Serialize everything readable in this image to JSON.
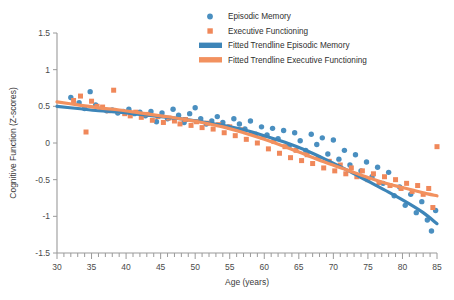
{
  "chart_data": {
    "type": "scatter",
    "title": "",
    "xlabel": "Age (years)",
    "ylabel": "Cognitive Function (Z-scores)",
    "xlim": [
      30,
      85
    ],
    "ylim": [
      -1.5,
      1.5
    ],
    "xticks": [
      30,
      35,
      40,
      45,
      50,
      55,
      60,
      65,
      70,
      75,
      80,
      85
    ],
    "xtick_labels": [
      "30",
      "35",
      "40",
      "45",
      "50",
      "55",
      "60",
      "65",
      "70",
      "75",
      "80",
      "85"
    ],
    "yticks": [
      1.5,
      1,
      0.5,
      0,
      -0.5,
      -1,
      -1.5
    ],
    "ytick_labels": [
      "1.5",
      "1",
      "0.5",
      "0",
      "-0.5",
      "-1",
      "-1.5"
    ],
    "minor_xtick_step": 1,
    "grid": false,
    "legend_position": "top-center",
    "colors": {
      "episodic_memory": "#4a8fc0",
      "executive_functioning": "#f0885a",
      "trendline_episodic_memory": "#3d85b8",
      "trendline_executive_functioning": "#f2915f",
      "axis": "#9a9a9a",
      "text": "#3b3b3b",
      "background": "#ffffff"
    },
    "legend": [
      {
        "label": "Episodic Memory",
        "marker": "circle",
        "color": "#4a8fc0"
      },
      {
        "label": "Executive Functioning",
        "marker": "square",
        "color": "#f0885a"
      },
      {
        "label": "Fitted Trendline Episodic Memory",
        "marker": "line",
        "color": "#3d85b8"
      },
      {
        "label": "Fitted Trendline Executive Functioning",
        "marker": "line",
        "color": "#f2915f"
      }
    ],
    "series": [
      {
        "name": "Episodic Memory",
        "marker": "circle",
        "color": "#4a8fc0",
        "points": [
          [
            32.0,
            0.62
          ],
          [
            33.2,
            0.55
          ],
          [
            34.0,
            0.47
          ],
          [
            34.8,
            0.7
          ],
          [
            35.6,
            0.52
          ],
          [
            36.4,
            0.46
          ],
          [
            37.2,
            0.44
          ],
          [
            38.0,
            0.45
          ],
          [
            38.8,
            0.41
          ],
          [
            39.6,
            0.43
          ],
          [
            40.4,
            0.46
          ],
          [
            41.2,
            0.4
          ],
          [
            42.0,
            0.42
          ],
          [
            42.8,
            0.37
          ],
          [
            43.6,
            0.43
          ],
          [
            44.4,
            0.29
          ],
          [
            45.2,
            0.41
          ],
          [
            46.0,
            0.33
          ],
          [
            46.8,
            0.46
          ],
          [
            47.6,
            0.38
          ],
          [
            48.4,
            0.28
          ],
          [
            49.2,
            0.4
          ],
          [
            50.0,
            0.48
          ],
          [
            50.8,
            0.33
          ],
          [
            51.6,
            0.26
          ],
          [
            52.4,
            0.3
          ],
          [
            53.2,
            0.36
          ],
          [
            54.0,
            0.28
          ],
          [
            54.8,
            0.22
          ],
          [
            55.6,
            0.33
          ],
          [
            56.4,
            0.26
          ],
          [
            57.2,
            0.19
          ],
          [
            58.0,
            0.3
          ],
          [
            58.8,
            0.12
          ],
          [
            59.6,
            0.22
          ],
          [
            60.4,
            0.11
          ],
          [
            61.2,
            0.2
          ],
          [
            62.0,
            0.06
          ],
          [
            62.8,
            0.17
          ],
          [
            63.6,
            -0.04
          ],
          [
            64.4,
            0.14
          ],
          [
            65.2,
            0.03
          ],
          [
            66.0,
            -0.1
          ],
          [
            66.8,
            0.12
          ],
          [
            67.6,
            -0.02
          ],
          [
            68.4,
            0.07
          ],
          [
            69.2,
            -0.15
          ],
          [
            70.0,
            0.04
          ],
          [
            70.8,
            -0.22
          ],
          [
            71.6,
            -0.1
          ],
          [
            72.4,
            -0.3
          ],
          [
            73.2,
            -0.16
          ],
          [
            74.0,
            -0.38
          ],
          [
            74.8,
            -0.26
          ],
          [
            75.6,
            -0.46
          ],
          [
            76.4,
            -0.33
          ],
          [
            77.2,
            -0.55
          ],
          [
            78.0,
            -0.4
          ],
          [
            78.8,
            -0.72
          ],
          [
            79.6,
            -0.6
          ],
          [
            80.4,
            -0.85
          ],
          [
            81.2,
            -0.7
          ],
          [
            82.0,
            -0.95
          ],
          [
            82.8,
            -0.8
          ],
          [
            83.6,
            -1.05
          ],
          [
            84.2,
            -1.2
          ],
          [
            84.8,
            -0.92
          ]
        ]
      },
      {
        "name": "Executive Functioning",
        "marker": "square",
        "color": "#f0885a",
        "points": [
          [
            32.4,
            0.58
          ],
          [
            33.4,
            0.64
          ],
          [
            34.2,
            0.15
          ],
          [
            35.0,
            0.57
          ],
          [
            35.8,
            0.5
          ],
          [
            36.6,
            0.49
          ],
          [
            37.4,
            0.44
          ],
          [
            38.2,
            0.72
          ],
          [
            39.0,
            0.43
          ],
          [
            39.8,
            0.4
          ],
          [
            40.6,
            0.37
          ],
          [
            41.4,
            0.42
          ],
          [
            42.2,
            0.35
          ],
          [
            43.0,
            0.39
          ],
          [
            43.8,
            0.31
          ],
          [
            44.6,
            0.36
          ],
          [
            45.4,
            0.28
          ],
          [
            46.2,
            0.34
          ],
          [
            47.0,
            0.3
          ],
          [
            47.8,
            0.26
          ],
          [
            48.6,
            0.32
          ],
          [
            49.4,
            0.24
          ],
          [
            50.2,
            0.29
          ],
          [
            51.0,
            0.21
          ],
          [
            51.8,
            0.27
          ],
          [
            52.6,
            0.19
          ],
          [
            53.4,
            0.25
          ],
          [
            54.2,
            0.14
          ],
          [
            55.0,
            0.22
          ],
          [
            55.8,
            0.1
          ],
          [
            56.6,
            0.18
          ],
          [
            57.4,
            0.05
          ],
          [
            58.2,
            0.13
          ],
          [
            59.0,
            0.0
          ],
          [
            59.8,
            0.08
          ],
          [
            60.6,
            -0.08
          ],
          [
            61.4,
            0.02
          ],
          [
            62.2,
            -0.14
          ],
          [
            63.0,
            -0.05
          ],
          [
            63.8,
            -0.2
          ],
          [
            64.6,
            -0.1
          ],
          [
            65.4,
            -0.24
          ],
          [
            66.2,
            -0.16
          ],
          [
            67.0,
            -0.28
          ],
          [
            67.8,
            -0.2
          ],
          [
            68.6,
            -0.34
          ],
          [
            69.4,
            -0.25
          ],
          [
            70.2,
            -0.38
          ],
          [
            71.0,
            -0.3
          ],
          [
            71.8,
            -0.42
          ],
          [
            72.6,
            -0.34
          ],
          [
            73.4,
            -0.46
          ],
          [
            74.2,
            -0.38
          ],
          [
            75.0,
            -0.5
          ],
          [
            75.8,
            -0.42
          ],
          [
            76.6,
            -0.54
          ],
          [
            77.4,
            -0.46
          ],
          [
            78.2,
            -0.58
          ],
          [
            79.0,
            -0.5
          ],
          [
            79.8,
            -0.62
          ],
          [
            80.6,
            -0.55
          ],
          [
            81.4,
            -0.66
          ],
          [
            82.2,
            -0.58
          ],
          [
            83.0,
            -0.7
          ],
          [
            83.8,
            -0.62
          ],
          [
            84.4,
            -0.88
          ],
          [
            85.0,
            -0.05
          ]
        ]
      }
    ],
    "trendlines": [
      {
        "name": "Fitted Trendline Episodic Memory",
        "color": "#3d85b8",
        "points": [
          [
            30,
            0.5
          ],
          [
            33,
            0.47
          ],
          [
            36,
            0.44
          ],
          [
            39,
            0.42
          ],
          [
            42,
            0.39
          ],
          [
            45,
            0.36
          ],
          [
            48,
            0.33
          ],
          [
            51,
            0.29
          ],
          [
            54,
            0.24
          ],
          [
            57,
            0.18
          ],
          [
            60,
            0.1
          ],
          [
            63,
            0.01
          ],
          [
            66,
            -0.1
          ],
          [
            69,
            -0.23
          ],
          [
            72,
            -0.37
          ],
          [
            75,
            -0.52
          ],
          [
            78,
            -0.67
          ],
          [
            81,
            -0.83
          ],
          [
            83,
            -0.95
          ],
          [
            85,
            -1.1
          ]
        ]
      },
      {
        "name": "Fitted Trendline Executive Functioning",
        "color": "#f2915f",
        "points": [
          [
            30,
            0.56
          ],
          [
            33,
            0.52
          ],
          [
            36,
            0.48
          ],
          [
            39,
            0.45
          ],
          [
            42,
            0.41
          ],
          [
            45,
            0.37
          ],
          [
            48,
            0.33
          ],
          [
            51,
            0.28
          ],
          [
            54,
            0.22
          ],
          [
            57,
            0.14
          ],
          [
            60,
            0.05
          ],
          [
            63,
            -0.05
          ],
          [
            66,
            -0.16
          ],
          [
            69,
            -0.27
          ],
          [
            72,
            -0.37
          ],
          [
            75,
            -0.47
          ],
          [
            78,
            -0.56
          ],
          [
            81,
            -0.63
          ],
          [
            83,
            -0.68
          ],
          [
            85,
            -0.72
          ]
        ]
      }
    ]
  }
}
